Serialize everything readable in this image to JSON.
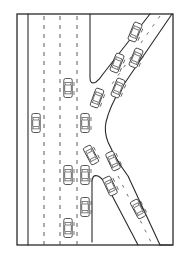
{
  "diagram": {
    "title": "",
    "colors": {
      "background": "#ffffff",
      "line": "#2a2a2a",
      "faded_car": "#b8b8b8"
    },
    "frame": {
      "x": 17,
      "y": 14,
      "width": 156,
      "height": 231
    },
    "mainline": {
      "left_edge_x": 28,
      "lane_divider_x": [
        44,
        60,
        77
      ],
      "lane_count": 4
    },
    "cars": [
      {
        "id": "main-1",
        "x": 68,
        "y": 88,
        "angle": 0,
        "style": "normal"
      },
      {
        "id": "main-2",
        "x": 36,
        "y": 123,
        "angle": 0,
        "style": "faded"
      },
      {
        "id": "main-3",
        "x": 85,
        "y": 123,
        "angle": 0,
        "style": "normal"
      },
      {
        "id": "main-4",
        "x": 68,
        "y": 175,
        "angle": 0,
        "style": "light"
      },
      {
        "id": "main-5",
        "x": 85,
        "y": 175,
        "angle": 0,
        "style": "normal"
      },
      {
        "id": "main-6",
        "x": 85,
        "y": 207,
        "angle": 0,
        "style": "normal"
      },
      {
        "id": "main-7",
        "x": 68,
        "y": 228,
        "angle": 0,
        "style": "normal"
      },
      {
        "id": "merge-1",
        "x": 97,
        "y": 98,
        "angle": 20,
        "style": "light"
      },
      {
        "id": "merge-2",
        "x": 91,
        "y": 155,
        "angle": -28,
        "style": "normal"
      },
      {
        "id": "upramp-1",
        "x": 135,
        "y": 32,
        "angle": 22,
        "style": "normal"
      },
      {
        "id": "upramp-2",
        "x": 117,
        "y": 63,
        "angle": 22,
        "style": "normal"
      },
      {
        "id": "upramp-3",
        "x": 136,
        "y": 58,
        "angle": 22,
        "style": "light"
      },
      {
        "id": "upramp-4",
        "x": 118,
        "y": 88,
        "angle": 22,
        "style": "normal"
      },
      {
        "id": "downramp-1",
        "x": 113,
        "y": 161,
        "angle": -25,
        "style": "light"
      },
      {
        "id": "downramp-2",
        "x": 110,
        "y": 186,
        "angle": -25,
        "style": "normal"
      },
      {
        "id": "downramp-3",
        "x": 138,
        "y": 209,
        "angle": -28,
        "style": "normal"
      }
    ]
  }
}
